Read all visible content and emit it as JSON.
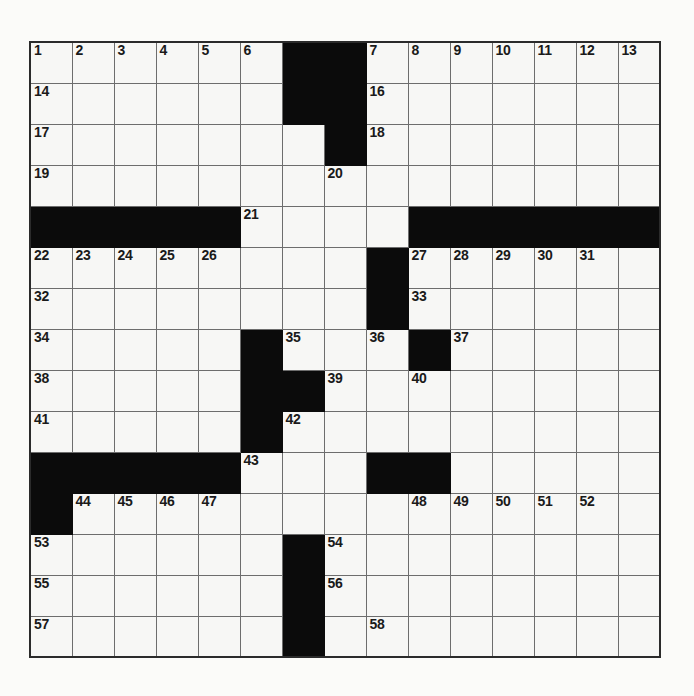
{
  "puzzle": {
    "kind": "crossword-grid",
    "rows": 15,
    "cols": 15,
    "cell_px": 42,
    "colors": {
      "block": "#0b0b0b",
      "cell": "#f7f7f5",
      "grid_line": "#6d6d6d",
      "border": "#2b2b2b",
      "number_text": "#1a1a1a",
      "page": "#ffffff"
    },
    "legend": {
      "block_char": "#",
      "open_char": "."
    },
    "layout": [
      "......##.......",
      "......##.......",
      ".......#.......",
      "...............",
      "#####....######",
      "........#......",
      "........#......",
      ".....#...#.....",
      ".....##........",
      ".....#.........",
      "#####...##.....",
      "#..............",
      "......#........",
      "......#........",
      "......#........"
    ],
    "numbers": [
      {
        "n": "1",
        "r": 1,
        "c": 1
      },
      {
        "n": "2",
        "r": 1,
        "c": 2
      },
      {
        "n": "3",
        "r": 1,
        "c": 3
      },
      {
        "n": "4",
        "r": 1,
        "c": 4
      },
      {
        "n": "5",
        "r": 1,
        "c": 5
      },
      {
        "n": "6",
        "r": 1,
        "c": 6
      },
      {
        "n": "7",
        "r": 1,
        "c": 9
      },
      {
        "n": "8",
        "r": 1,
        "c": 10
      },
      {
        "n": "9",
        "r": 1,
        "c": 11
      },
      {
        "n": "10",
        "r": 1,
        "c": 12
      },
      {
        "n": "11",
        "r": 1,
        "c": 13
      },
      {
        "n": "12",
        "r": 1,
        "c": 14
      },
      {
        "n": "13",
        "r": 1,
        "c": 15
      },
      {
        "n": "14",
        "r": 2,
        "c": 1
      },
      {
        "n": "15",
        "r": 2,
        "c": 7
      },
      {
        "n": "16",
        "r": 2,
        "c": 9
      },
      {
        "n": "17",
        "r": 3,
        "c": 1
      },
      {
        "n": "18",
        "r": 3,
        "c": 9
      },
      {
        "n": "19",
        "r": 4,
        "c": 1
      },
      {
        "n": "20",
        "r": 4,
        "c": 8
      },
      {
        "n": "21",
        "r": 5,
        "c": 6
      },
      {
        "n": "22",
        "r": 6,
        "c": 1
      },
      {
        "n": "23",
        "r": 6,
        "c": 2
      },
      {
        "n": "24",
        "r": 6,
        "c": 3
      },
      {
        "n": "25",
        "r": 6,
        "c": 4
      },
      {
        "n": "26",
        "r": 6,
        "c": 5
      },
      {
        "n": "27",
        "r": 6,
        "c": 10
      },
      {
        "n": "28",
        "r": 6,
        "c": 11
      },
      {
        "n": "29",
        "r": 6,
        "c": 12
      },
      {
        "n": "30",
        "r": 6,
        "c": 13
      },
      {
        "n": "31",
        "r": 6,
        "c": 14
      },
      {
        "n": "32",
        "r": 7,
        "c": 1
      },
      {
        "n": "33",
        "r": 7,
        "c": 10
      },
      {
        "n": "34",
        "r": 8,
        "c": 1
      },
      {
        "n": "35",
        "r": 8,
        "c": 7
      },
      {
        "n": "36",
        "r": 8,
        "c": 9
      },
      {
        "n": "37",
        "r": 8,
        "c": 11
      },
      {
        "n": "38",
        "r": 9,
        "c": 1
      },
      {
        "n": "39",
        "r": 9,
        "c": 8
      },
      {
        "n": "40",
        "r": 9,
        "c": 10
      },
      {
        "n": "41",
        "r": 10,
        "c": 1
      },
      {
        "n": "42",
        "r": 10,
        "c": 7
      },
      {
        "n": "43",
        "r": 11,
        "c": 6
      },
      {
        "n": "44",
        "r": 12,
        "c": 2
      },
      {
        "n": "45",
        "r": 12,
        "c": 3
      },
      {
        "n": "46",
        "r": 12,
        "c": 4
      },
      {
        "n": "47",
        "r": 12,
        "c": 5
      },
      {
        "n": "48",
        "r": 12,
        "c": 10
      },
      {
        "n": "49",
        "r": 12,
        "c": 11
      },
      {
        "n": "50",
        "r": 12,
        "c": 12
      },
      {
        "n": "51",
        "r": 12,
        "c": 13
      },
      {
        "n": "52",
        "r": 12,
        "c": 14
      },
      {
        "n": "53",
        "r": 13,
        "c": 1
      },
      {
        "n": "54",
        "r": 13,
        "c": 8
      },
      {
        "n": "55",
        "r": 14,
        "c": 1
      },
      {
        "n": "56",
        "r": 14,
        "c": 8
      },
      {
        "n": "57",
        "r": 15,
        "c": 1
      },
      {
        "n": "58",
        "r": 15,
        "c": 9
      }
    ]
  }
}
